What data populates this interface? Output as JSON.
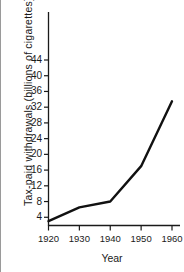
{
  "chart_data": {
    "type": "line",
    "title": "",
    "subtitle": "",
    "xlabel": "Year",
    "ylabel": "Tax-paid withdrawals (billions of cigarettes)",
    "x": [
      1920,
      1930,
      1940,
      1950,
      1960
    ],
    "series": [
      {
        "name": "Tax-paid withdrawals",
        "values": [
          3,
          6.5,
          8,
          17,
          33.5
        ],
        "color": "#111111"
      }
    ],
    "xlim": [
      1920,
      1960
    ],
    "ylim": [
      0,
      46
    ],
    "xticks": [
      1920,
      1930,
      1940,
      1950,
      1960
    ],
    "xtick_labels": [
      "1920",
      "1930",
      "1940",
      "1950",
      "1960"
    ],
    "yticks": [
      4,
      8,
      12,
      16,
      20,
      24,
      28,
      32,
      36,
      40,
      44
    ],
    "ytick_labels": [
      "4",
      "8",
      "12",
      "16",
      "20",
      "24",
      "28",
      "32",
      "36",
      "40",
      "44"
    ],
    "grid": false,
    "legend": false,
    "legend_position": "none",
    "annotations": []
  },
  "style": {
    "background": "#ffffff",
    "axis_color": "#1a1a1a",
    "frame_color": "#9a9a9a",
    "line_color": "#111111",
    "line_width": 2.4
  }
}
